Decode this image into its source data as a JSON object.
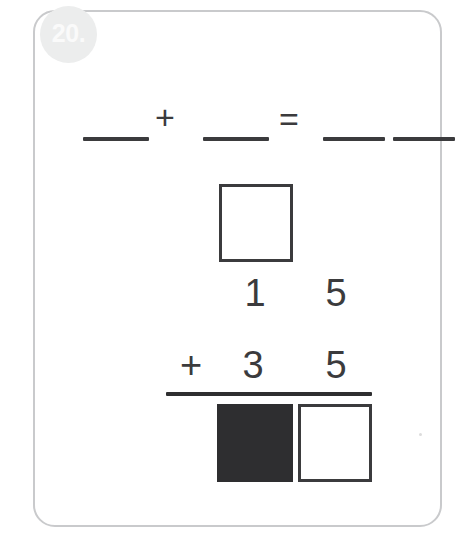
{
  "card": {
    "badge_label": "20.",
    "badge_bg_color": "#eceded",
    "badge_text_color": "#fafafa",
    "border_color": "#c9cacc",
    "ink_color": "#3b3b3d"
  },
  "equation_row": {
    "plus_symbol": "+",
    "equals_symbol": "=",
    "addend_1_blank": "",
    "addend_2_blank": "",
    "sum_tens_blank": "",
    "sum_ones_blank": ""
  },
  "vertical_addition": {
    "carry_box_value": "",
    "top_number_tens": "1",
    "top_number_ones": "5",
    "operator": "+",
    "bottom_number_tens": "3",
    "bottom_number_ones": "5",
    "answer_tens_value": "",
    "answer_tens_state": "filled",
    "answer_ones_value": "",
    "answer_ones_state": "empty"
  },
  "chart_data": {
    "type": "table",
    "rows": [
      {
        "label": "carry",
        "tens": "",
        "ones": ""
      },
      {
        "label": "addend 1",
        "tens": "1",
        "ones": "5"
      },
      {
        "label": "addend 2",
        "tens": "3",
        "ones": "5"
      },
      {
        "label": "sum",
        "tens": "",
        "ones": ""
      }
    ]
  }
}
